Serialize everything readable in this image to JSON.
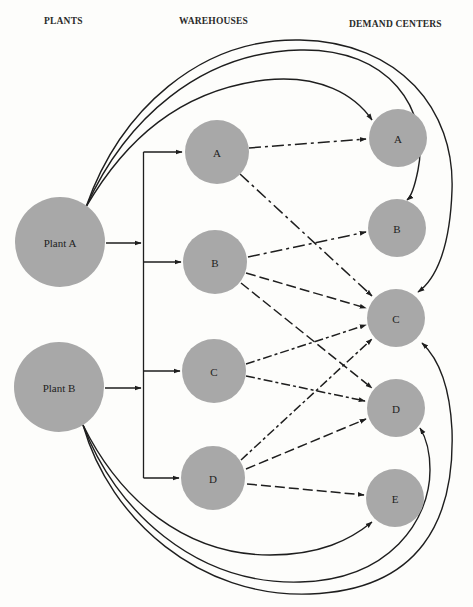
{
  "headers": {
    "plants": "PLANTS",
    "warehouses": "WAREHOUSES",
    "demand_centers": "DEMAND CENTERS"
  },
  "colors": {
    "node_fill": "#a8a8a8",
    "edge": "#1e1e1e",
    "background": "#fdfdfb"
  },
  "plants": [
    {
      "id": "plant-a",
      "label": "Plant A"
    },
    {
      "id": "plant-b",
      "label": "Plant B"
    }
  ],
  "warehouses": [
    {
      "id": "wh-a",
      "label": "A"
    },
    {
      "id": "wh-b",
      "label": "B"
    },
    {
      "id": "wh-c",
      "label": "C"
    },
    {
      "id": "wh-d",
      "label": "D"
    }
  ],
  "demand_centers": [
    {
      "id": "dc-a",
      "label": "A"
    },
    {
      "id": "dc-b",
      "label": "B"
    },
    {
      "id": "dc-c",
      "label": "C"
    },
    {
      "id": "dc-d",
      "label": "D"
    },
    {
      "id": "dc-e",
      "label": "E"
    }
  ],
  "edges": {
    "plant_to_warehouse_bus": [
      "Plant A → Warehouses",
      "Plant B → Warehouses"
    ],
    "warehouse_to_demand": [
      {
        "from": "Warehouse A",
        "to": "Demand A",
        "style": "dash-dot"
      },
      {
        "from": "Warehouse A",
        "to": "Demand C",
        "style": "dash-dot"
      },
      {
        "from": "Warehouse B",
        "to": "Demand B",
        "style": "dash-dot"
      },
      {
        "from": "Warehouse B",
        "to": "Demand C",
        "style": "dash"
      },
      {
        "from": "Warehouse B",
        "to": "Demand D",
        "style": "dash"
      },
      {
        "from": "Warehouse C",
        "to": "Demand C",
        "style": "dash-dot"
      },
      {
        "from": "Warehouse C",
        "to": "Demand D",
        "style": "dash-dot"
      },
      {
        "from": "Warehouse D",
        "to": "Demand C",
        "style": "dash-dot"
      },
      {
        "from": "Warehouse D",
        "to": "Demand D",
        "style": "dash"
      },
      {
        "from": "Warehouse D",
        "to": "Demand E",
        "style": "dash"
      }
    ],
    "plant_direct_to_demand": [
      {
        "from": "Plant A",
        "to": "Demand A"
      },
      {
        "from": "Plant A",
        "to": "Demand B"
      },
      {
        "from": "Plant A",
        "to": "Demand C"
      },
      {
        "from": "Plant B",
        "to": "Demand C"
      },
      {
        "from": "Plant B",
        "to": "Demand D"
      },
      {
        "from": "Plant B",
        "to": "Demand E"
      }
    ]
  }
}
